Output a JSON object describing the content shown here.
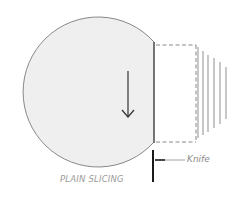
{
  "diagram": {
    "title": "PLAIN SLICING",
    "labels": {
      "knife": "Knife",
      "caption": "PLAIN SLICING"
    },
    "colors": {
      "food_fill": "#efefef",
      "outline": "#7a7a7a",
      "knife": "#1a1a1a",
      "slices": "#9a9a9a",
      "text": "#8a8a8a"
    },
    "elements": [
      {
        "id": "food-round",
        "type": "truncated-circle",
        "description": "round food item with flat cut face on right"
      },
      {
        "id": "cut-direction-arrow",
        "type": "arrow",
        "direction": "down"
      },
      {
        "id": "removed-slice-outline",
        "type": "dashed-rectangle"
      },
      {
        "id": "slices",
        "type": "line-group",
        "count": 6
      },
      {
        "id": "knife",
        "type": "vertical-bar"
      },
      {
        "id": "knife-pointer",
        "type": "leader-line",
        "target": "knife"
      }
    ]
  }
}
